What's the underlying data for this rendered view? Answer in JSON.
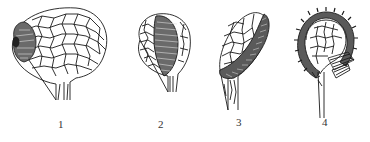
{
  "figure": {
    "panels": [
      {
        "label": "1",
        "subject": "sporangium with apical annulus cap"
      },
      {
        "label": "2",
        "subject": "sporangium with oblique wide annulus band"
      },
      {
        "label": "3",
        "subject": "sporangium with oblique annulus ring on stalk"
      },
      {
        "label": "4",
        "subject": "sporangium with vertical interrupted annulus and stomium"
      }
    ],
    "colors": {
      "ink": "#1a1a1a",
      "shade": "#555555",
      "background": "#ffffff"
    }
  }
}
